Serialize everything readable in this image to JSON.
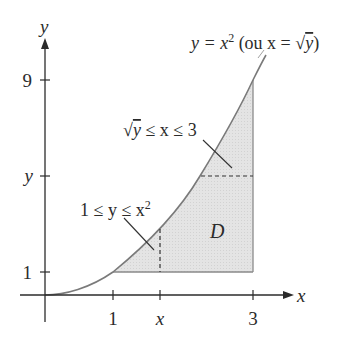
{
  "diagram": {
    "type": "region-of-integration",
    "axes": {
      "x_label": "x",
      "y_label": "y",
      "x_ticks": [
        "1",
        "x",
        "3"
      ],
      "y_ticks": [
        "9",
        "y",
        "1"
      ]
    },
    "curve_label": {
      "lhs": "y = x",
      "exp": "2",
      "rest": " (ou x = ",
      "sqrt": "√",
      "sqrt_arg": "y",
      "close": ")"
    },
    "region_label": "D",
    "vertical_strip_label": {
      "text": "1 ≤ y ≤ x",
      "exp": "2"
    },
    "horizontal_strip_label": {
      "sqrt": "√",
      "arg": "y",
      "text": " ≤ x ≤ 3"
    },
    "colors": {
      "axis": "#2b2b2b",
      "curve": "#7a7a7a",
      "region_fill": "#e3e3e3",
      "region_edge": "#8a8a8a"
    }
  }
}
